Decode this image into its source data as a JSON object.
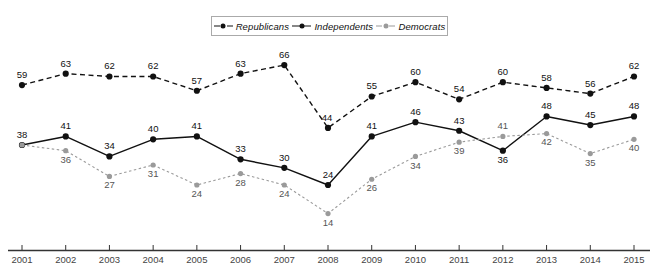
{
  "legend": {
    "items": [
      {
        "label": "Republicans",
        "style": "dashed",
        "color": "#111111",
        "icon": "line-marker-dashed-icon"
      },
      {
        "label": "Independents",
        "style": "solid",
        "color": "#111111",
        "icon": "line-marker-solid-icon"
      },
      {
        "label": "Democrats",
        "style": "dotted",
        "color": "#9a9a9a",
        "icon": "line-marker-dotted-icon"
      }
    ]
  },
  "chart_data": {
    "type": "line",
    "title": "",
    "subtitle": "",
    "xlabel": "",
    "ylabel": "",
    "categories": [
      "2001",
      "2002",
      "2003",
      "2004",
      "2005",
      "2006",
      "2007",
      "2008",
      "2009",
      "2010",
      "2011",
      "2012",
      "2013",
      "2014",
      "2015"
    ],
    "x": [
      2001,
      2002,
      2003,
      2004,
      2005,
      2006,
      2007,
      2008,
      2009,
      2010,
      2011,
      2012,
      2013,
      2014,
      2015
    ],
    "ylim": [
      0,
      70
    ],
    "grid": false,
    "legend_position": "top-center",
    "data_labels": true,
    "series": [
      {
        "name": "Republicans",
        "color": "#111111",
        "line_style": "dashed",
        "marker": "circle",
        "values": [
          59,
          63,
          62,
          62,
          57,
          63,
          66,
          44,
          55,
          60,
          54,
          60,
          58,
          56,
          62
        ]
      },
      {
        "name": "Independents",
        "color": "#111111",
        "line_style": "solid",
        "marker": "circle",
        "values": [
          38,
          41,
          34,
          40,
          41,
          33,
          30,
          24,
          41,
          46,
          43,
          36,
          48,
          45,
          48
        ]
      },
      {
        "name": "Democrats",
        "color": "#9a9a9a",
        "line_style": "dotted",
        "marker": "circle",
        "values": [
          38,
          36,
          27,
          31,
          24,
          28,
          24,
          14,
          26,
          34,
          39,
          41,
          42,
          35,
          40
        ]
      }
    ]
  },
  "axis": {
    "tick_labels": [
      "2001",
      "2002",
      "2003",
      "2004",
      "2005",
      "2006",
      "2007",
      "2008",
      "2009",
      "2010",
      "2011",
      "2012",
      "2013",
      "2014",
      "2015"
    ],
    "line_color": "#333333"
  }
}
